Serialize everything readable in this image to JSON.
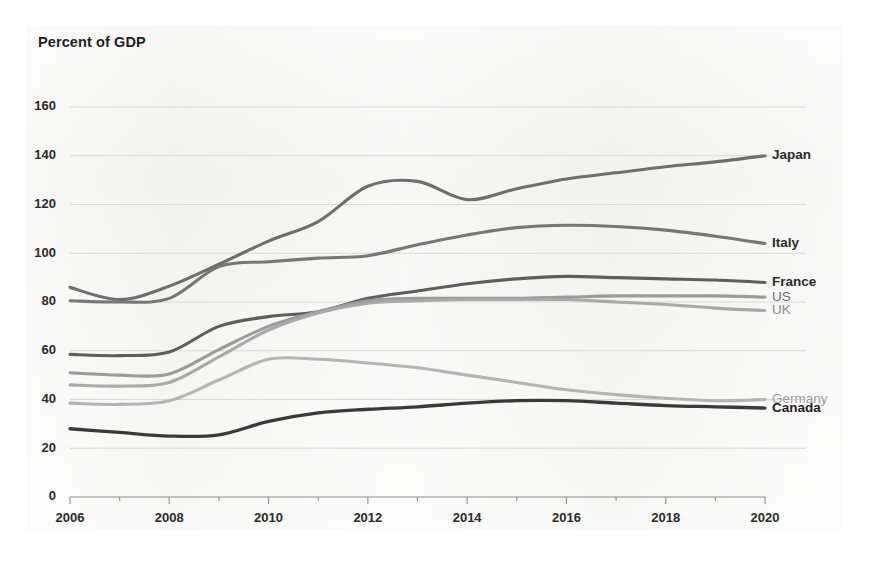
{
  "chart_title": "Percent of GDP",
  "labels": {
    "japan": "Japan",
    "italy": "Italy",
    "france": "France",
    "us": "US",
    "uk": "UK",
    "germany": "Germany",
    "canada": "Canada"
  },
  "chart_data": {
    "type": "line",
    "title": "Percent of GDP",
    "xlabel": "",
    "ylabel": "Percent of GDP",
    "xlim": [
      2006,
      2020
    ],
    "ylim": [
      0,
      160
    ],
    "ytick_step": 20,
    "xtick_step": 2,
    "grid": true,
    "legend_position": "right-inline-labels",
    "x": [
      2006,
      2007,
      2008,
      2009,
      2010,
      2011,
      2012,
      2013,
      2014,
      2015,
      2016,
      2017,
      2018,
      2019,
      2020
    ],
    "ytick_labels": [
      "0",
      "20",
      "40",
      "60",
      "80",
      "100",
      "120",
      "140",
      "160"
    ],
    "xtick_labels": [
      "2006",
      "2008",
      "2010",
      "2012",
      "2014",
      "2016",
      "2018",
      "2020"
    ],
    "series": [
      {
        "name": "Japan",
        "color": "#6e6e6e",
        "width": 3.1,
        "label_color": "#2b2a28",
        "label_weight": "bold",
        "label_y": 140.0,
        "values": [
          86.0,
          81.0,
          86.5,
          95.5,
          105.0,
          113.0,
          127.5,
          129.5,
          122.0,
          126.5,
          130.5,
          133.0,
          135.5,
          137.5,
          140.0
        ]
      },
      {
        "name": "Italy",
        "color": "#777777",
        "width": 3.1,
        "label_color": "#2b2a28",
        "label_weight": "bold",
        "label_y": 104.0,
        "values": [
          80.5,
          80.0,
          81.5,
          94.5,
          96.5,
          98.0,
          99.0,
          103.5,
          107.5,
          110.5,
          111.5,
          111.0,
          109.5,
          107.0,
          104.0
        ]
      },
      {
        "name": "France",
        "color": "#5e5e5e",
        "width": 3.1,
        "label_color": "#2b2a28",
        "label_weight": "bold",
        "label_y": 88.0,
        "values": [
          58.5,
          58.0,
          59.5,
          70.0,
          74.0,
          76.0,
          81.5,
          84.5,
          87.5,
          89.5,
          90.5,
          90.0,
          89.5,
          89.0,
          88.0
        ]
      },
      {
        "name": "US",
        "color": "#9b9b9b",
        "width": 3.1,
        "label_color": "#6f6f6f",
        "label_weight": "normal",
        "label_y": 82.0,
        "values": [
          51.0,
          50.0,
          50.5,
          60.5,
          70.0,
          76.0,
          80.5,
          81.5,
          81.5,
          81.5,
          82.0,
          82.5,
          82.5,
          82.5,
          82.0
        ]
      },
      {
        "name": "UK",
        "color": "#a9a9a9",
        "width": 3.1,
        "label_color": "#8b8b8b",
        "label_weight": "normal",
        "label_y": 76.5,
        "values": [
          46.0,
          45.5,
          47.0,
          57.5,
          68.5,
          75.5,
          79.5,
          80.5,
          81.0,
          81.0,
          81.0,
          80.0,
          79.0,
          77.5,
          76.5
        ]
      },
      {
        "name": "Germany",
        "color": "#b4b4b4",
        "width": 3.1,
        "label_color": "#9d9d9d",
        "label_weight": "normal",
        "label_y": 40.0,
        "values": [
          38.5,
          38.0,
          39.5,
          48.0,
          56.5,
          56.5,
          55.0,
          53.0,
          50.0,
          47.0,
          44.0,
          42.0,
          40.5,
          39.5,
          40.0
        ]
      },
      {
        "name": "Canada",
        "color": "#3a3a3a",
        "width": 3.3,
        "label_color": "#1d1c1c",
        "label_weight": "bold",
        "label_y": 36.5,
        "values": [
          28.0,
          26.5,
          25.0,
          25.5,
          31.0,
          34.5,
          36.0,
          37.0,
          38.5,
          39.5,
          39.5,
          38.5,
          37.5,
          37.0,
          36.5
        ]
      }
    ]
  }
}
